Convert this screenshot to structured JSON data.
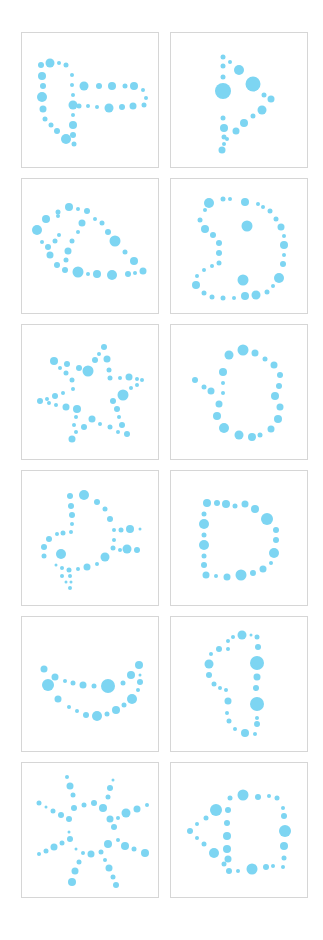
{
  "figure": {
    "layout": {
      "columns": 2,
      "rows": 6
    },
    "dot_color": "#7dd5f2",
    "dot_core_color": "#68cdef",
    "border_color": "#d6d6d6",
    "background": "#ffffff"
  },
  "panels": [
    {
      "id": 1,
      "shape": "closed dotted outline with horizontal bar extending right (T/flag-like shape)"
    },
    {
      "id": 2,
      "shape": "dotted triangle / play-arrow pointing right"
    },
    {
      "id": 3,
      "shape": "dotted teardrop / leaf shape with inner loop"
    },
    {
      "id": 4,
      "shape": "dotted reversed-S / 'B'-like curve with two inner dots"
    },
    {
      "id": 5,
      "shape": "dotted five-pointed star"
    },
    {
      "id": 6,
      "shape": "dotted oval with short tail to the left (fish-like)"
    },
    {
      "id": 7,
      "shape": "dotted shape resembling a bird/plane with tail and wing lines"
    },
    {
      "id": 8,
      "shape": "dotted letter D"
    },
    {
      "id": 9,
      "shape": "dotted crescent / smile (boat) shape"
    },
    {
      "id": 10,
      "shape": "dotted vertical half-oval with large beads on right side"
    },
    {
      "id": 11,
      "shape": "dotted eight-armed asterisk / starburst"
    },
    {
      "id": 12,
      "shape": "dotted square attached to a left-pointing triangle"
    }
  ]
}
